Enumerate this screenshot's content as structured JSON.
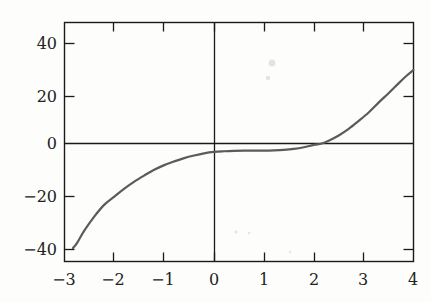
{
  "figure": {
    "title": "",
    "background_color": "#fdfdfc",
    "curve_color": "#5b5b5b",
    "axis_color": "#1a1a1a"
  },
  "chart_data": {
    "type": "line",
    "title": "",
    "subtitle": "",
    "xlabel": "",
    "ylabel": "",
    "xlim": [
      -3,
      4
    ],
    "ylim": [
      -47,
      47
    ],
    "xticks": [
      -3,
      -2,
      -1,
      0,
      1,
      2,
      3,
      4
    ],
    "xtick_labels": [
      "−3",
      "−2",
      "−1",
      "0",
      "1",
      "2",
      "3",
      "4"
    ],
    "yticks": [
      -40,
      -20,
      0,
      20,
      40
    ],
    "ytick_labels": [
      "−40",
      "−20",
      "0",
      "20",
      "40"
    ],
    "grid": false,
    "legend": null,
    "legend_position": "none",
    "axis_lines": {
      "x_axis_at_y": 0,
      "y_axis_at_x": 0
    },
    "series": [
      {
        "name": "curve",
        "color": "#5b5b5b",
        "x": [
          -2.83,
          -2.75,
          -2.6,
          -2.4,
          -2.2,
          -2.0,
          -1.8,
          -1.6,
          -1.4,
          -1.2,
          -1.0,
          -0.8,
          -0.6,
          -0.4,
          -0.2,
          0.0,
          0.2,
          0.4,
          0.6,
          0.8,
          1.0,
          1.2,
          1.4,
          1.6,
          1.8,
          2.0,
          2.16,
          2.3,
          2.5,
          2.7,
          2.9,
          3.1,
          3.3,
          3.5,
          3.7,
          3.85,
          4.0
        ],
        "y": [
          -44.5,
          -42.4,
          -37.0,
          -31.0,
          -26.0,
          -22.6,
          -19.2,
          -16.2,
          -13.6,
          -11.2,
          -9.2,
          -7.6,
          -6.2,
          -5.1,
          -4.2,
          -3.6,
          -3.3,
          -3.1,
          -3.0,
          -3.0,
          -3.0,
          -2.9,
          -2.7,
          -2.3,
          -1.6,
          -0.6,
          0.0,
          1.2,
          3.4,
          6.2,
          9.6,
          13.2,
          17.4,
          21.4,
          25.6,
          28.6,
          31.3
        ]
      }
    ]
  }
}
